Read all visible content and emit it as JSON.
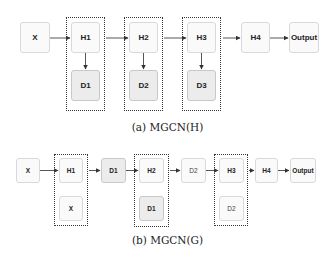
{
  "diagram_a": {
    "caption": "(a) MGCN(H)",
    "nodes": {
      "x": "X",
      "h1": "H1",
      "d1": "D1",
      "h2": "H2",
      "d2": "D2",
      "h3": "H3",
      "d3": "D3",
      "h4": "H4",
      "output": "Output"
    },
    "groups": [
      "H1+D1",
      "H2+D2",
      "H3+D3"
    ],
    "edges": [
      [
        "X",
        "H1"
      ],
      [
        "H1",
        "D1"
      ],
      [
        "H1 group",
        "H2"
      ],
      [
        "H2",
        "D2"
      ],
      [
        "H2 group",
        "H3"
      ],
      [
        "H3",
        "D3"
      ],
      [
        "H3 group",
        "H4"
      ],
      [
        "H4",
        "Output"
      ]
    ]
  },
  "diagram_b": {
    "caption": "(b) MGCN(G)",
    "nodes": {
      "x": "X",
      "h1": "H1",
      "x_inner": "X",
      "d1": "D1",
      "h2": "H2",
      "d1_inner": "D1",
      "d2": "D2",
      "h3": "H3",
      "d2_inner": "D2",
      "h4": "H4",
      "output": "Output"
    },
    "groups": [
      "H1+X",
      "H2+D1",
      "H3+D2"
    ],
    "edges": [
      [
        "X",
        "H1"
      ],
      [
        "H1 group",
        "D1"
      ],
      [
        "D1",
        "H2"
      ],
      [
        "H2 group",
        "D2"
      ],
      [
        "D2",
        "H3"
      ],
      [
        "H3 group",
        "H4"
      ],
      [
        "H4",
        "Output"
      ]
    ]
  },
  "colors": {
    "node_fill": "#fafafa",
    "node_filled": "#ececec",
    "border": "#d9d9d9",
    "arrow": "#333333",
    "group_border": "#333333"
  }
}
